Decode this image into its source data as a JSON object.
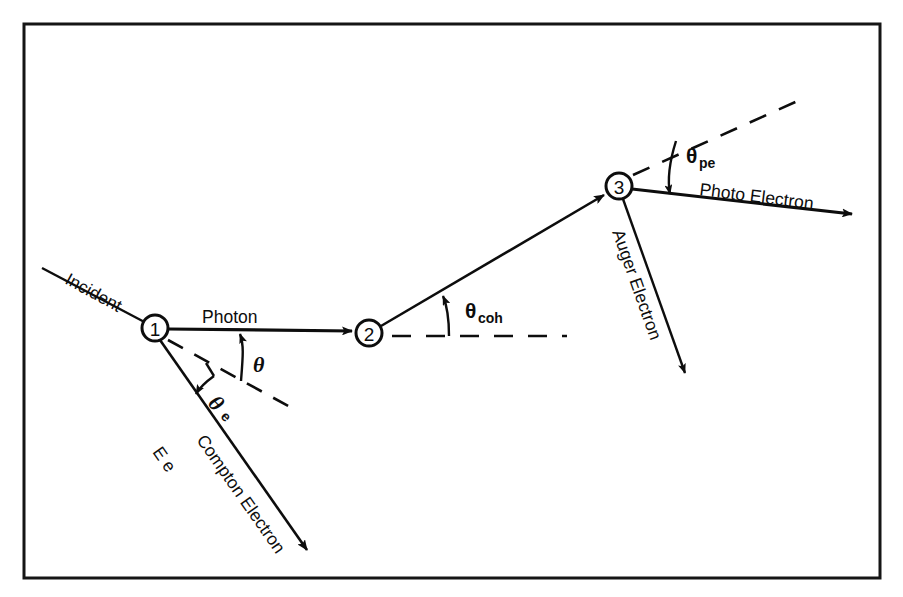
{
  "figure": {
    "background_color": "#ffffff",
    "ink_color": "#0d0d0d",
    "frame": {
      "x": 24,
      "y": 24,
      "width": 856,
      "height": 554
    }
  },
  "vertices": [
    {
      "id": "vertex-1",
      "label": "1",
      "cx": 155,
      "cy": 328,
      "r": 13
    },
    {
      "id": "vertex-2",
      "label": "2",
      "cx": 369,
      "cy": 333,
      "r": 13
    },
    {
      "id": "vertex-3",
      "label": "3",
      "cx": 619,
      "cy": 186,
      "r": 13
    }
  ],
  "labels": {
    "incident": "Incident",
    "photon": "Photon",
    "compton_electron": "Compton Electron",
    "compton_energy": "E e",
    "auger_electron": "Auger Electron",
    "photo_electron": "Photo Electron",
    "theta": "θ",
    "theta_e_base": "θ",
    "theta_e_sub": "e",
    "theta_coh_base": "θ",
    "theta_coh_sub": "coh",
    "theta_pe_base": "θ",
    "theta_pe_sub": "pe"
  },
  "rays": [
    {
      "name": "incident-photon-ray",
      "from": [
        42,
        268
      ],
      "to": [
        155,
        328
      ],
      "arrow": false
    },
    {
      "name": "scattered-photon-ray",
      "from": [
        155,
        328
      ],
      "to": [
        369,
        333
      ],
      "arrow": true
    },
    {
      "name": "coherent-photon-ray",
      "from": [
        369,
        333
      ],
      "to": [
        619,
        186
      ],
      "arrow": true
    },
    {
      "name": "compton-electron-ray",
      "from": [
        155,
        328
      ],
      "to": [
        310,
        553
      ],
      "arrow": true
    },
    {
      "name": "auger-electron-ray",
      "from": [
        619,
        186
      ],
      "to": [
        687,
        378
      ],
      "arrow": true
    },
    {
      "name": "photo-electron-ray",
      "from": [
        619,
        186
      ],
      "to": [
        858,
        216
      ],
      "arrow": true
    }
  ],
  "dashed_lines": [
    {
      "name": "vertex1-axis-dashed",
      "from": [
        168,
        340
      ],
      "to": [
        288,
        406
      ]
    },
    {
      "name": "vertex2-axis-dashed",
      "from": [
        392,
        336
      ],
      "to": [
        566,
        336
      ]
    },
    {
      "name": "vertex3-axis-dashed",
      "from": [
        634,
        174
      ],
      "to": [
        800,
        100
      ]
    }
  ],
  "angles": [
    {
      "name": "theta-arc",
      "vertex": "vertex-1",
      "text": "θ"
    },
    {
      "name": "theta-e-arc",
      "vertex": "vertex-1",
      "text": "θe"
    },
    {
      "name": "theta-coh-arc",
      "vertex": "vertex-2",
      "text": "θcoh"
    },
    {
      "name": "theta-pe-arc",
      "vertex": "vertex-3",
      "text": "θpe"
    }
  ]
}
